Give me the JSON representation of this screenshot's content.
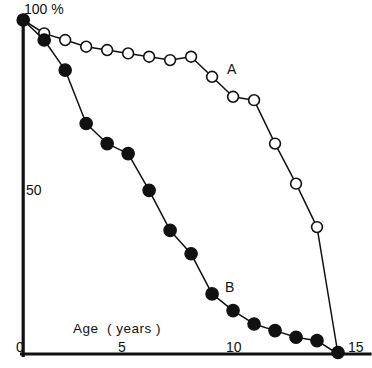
{
  "chart_data": {
    "type": "line",
    "title": "",
    "subtitle": "",
    "xlabel": "Age  ( years )",
    "ylabel": "",
    "y_unit_label": "100 %",
    "y_mid_label": "50",
    "xlim": [
      0,
      15
    ],
    "ylim": [
      0,
      100
    ],
    "grid": false,
    "legend_position": "inline-annotation",
    "x_ticks": [
      0,
      5,
      10,
      15
    ],
    "x_tick_labels": [
      "0",
      "5",
      "10",
      "15"
    ],
    "y_ticks": [
      50,
      100
    ],
    "y_tick_labels": [
      "50",
      "100 %"
    ],
    "axes_style": "left-and-bottom-spine-only",
    "series": [
      {
        "name": "A",
        "marker": "open-circle",
        "label": "A",
        "label_x": 10.0,
        "label_y": 85.0,
        "x": [
          0,
          1,
          2,
          3,
          4,
          5,
          6,
          7,
          8,
          9,
          10,
          11,
          12,
          13,
          14,
          15
        ],
        "values": [
          100,
          96,
          94,
          92,
          91,
          90,
          89,
          88,
          89,
          83,
          77,
          76,
          63,
          51,
          38,
          0
        ]
      },
      {
        "name": "B",
        "marker": "filled-circle",
        "label": "B",
        "label_x": 9.8,
        "label_y": 22.0,
        "x": [
          0,
          1,
          2,
          3,
          4,
          5,
          6,
          7,
          8,
          9,
          10,
          11,
          12,
          13,
          14,
          15
        ],
        "values": [
          100,
          94,
          85,
          69,
          63,
          60,
          49,
          37,
          30,
          18,
          13,
          9,
          7,
          5,
          4,
          0
        ]
      }
    ],
    "annotations": [
      {
        "text": "A",
        "x": 10.0,
        "y": 85.0
      },
      {
        "text": "B",
        "x": 9.8,
        "y": 22.0
      }
    ]
  },
  "axis": {
    "x_title": "Age  ( years )",
    "x_tick_0": "0",
    "x_tick_5": "5",
    "x_tick_10": "10",
    "x_tick_15": "15",
    "y_top": "100 %",
    "y_mid": "50"
  },
  "labels": {
    "series_a": "A",
    "series_b": "B"
  },
  "colors": {
    "ink": "#111111",
    "background": "#ffffff",
    "marker_open_fill": "#ffffff",
    "marker_filled_fill": "#111111"
  }
}
